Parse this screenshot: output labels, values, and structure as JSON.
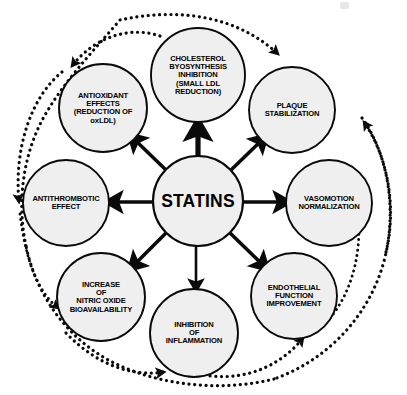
{
  "diagram": {
    "center": {
      "id": "statins",
      "label": "STATINS",
      "cx": 198,
      "cy": 201,
      "r": 45
    },
    "colors": {
      "node_fill": "#efefef",
      "stroke": "#0a0a0a",
      "background": "#ffffff"
    },
    "nodes": [
      {
        "id": "cholesterol-biosynthesis-inhibition",
        "label": "CHOLESTEROL\nBYOSYNTHESIS\nINHIBITION\n(SMALL LDL\nREDUCTION)",
        "cx": 198,
        "cy": 75,
        "r": 47,
        "arrow_weight": "thick"
      },
      {
        "id": "plaque-stabilization",
        "label": "PLAQUE\nSTABILIZATION",
        "cx": 292,
        "cy": 110,
        "r": 43,
        "arrow_weight": "medium"
      },
      {
        "id": "vasomotion-normalization",
        "label": "VASOMOTION\nNORMALIZATION",
        "cx": 329,
        "cy": 203,
        "r": 43,
        "arrow_weight": "medium"
      },
      {
        "id": "endothelial-function-improvement",
        "label": "ENDOTHELIAL\nFUNCTION\nIMPROVEMENT",
        "cx": 294,
        "cy": 296,
        "r": 43,
        "arrow_weight": "medium"
      },
      {
        "id": "inhibition-of-inflammation",
        "label": "INHIBITION\nOF\nINFLAMMATION",
        "cx": 194,
        "cy": 333,
        "r": 44,
        "arrow_weight": "medium"
      },
      {
        "id": "increase-nitric-oxide-bioavailability",
        "label": "INCREASE\nOF\nNITRIC OXIDE\nBIOAVAILABILITY",
        "cx": 101,
        "cy": 297,
        "r": 44,
        "arrow_weight": "medium"
      },
      {
        "id": "antithrombotic-effect",
        "label": "ANTITHROMBOTIC\nEFFECT",
        "cx": 66,
        "cy": 203,
        "r": 43,
        "arrow_weight": "medium"
      },
      {
        "id": "antioxidant-effects",
        "label": "ANTIOXIDANT\nEFFECTS\n(REDUCTION OF\noxLDL)",
        "cx": 103,
        "cy": 108,
        "r": 44,
        "arrow_weight": "medium"
      }
    ],
    "outer_cycle": {
      "style": "dotted",
      "description": "dotted arcs linking adjacent peripheral nodes around the ring"
    }
  }
}
